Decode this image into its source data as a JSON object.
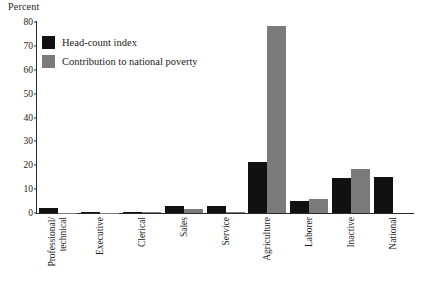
{
  "chart_data": {
    "type": "bar",
    "title": "",
    "ylabel": "Percent",
    "xlabel": "",
    "ylim": [
      0,
      80
    ],
    "yticks": [
      0,
      10,
      20,
      30,
      40,
      50,
      60,
      70,
      80
    ],
    "grid": false,
    "legend_position": "top-left",
    "categories": [
      "Professional/\ntechnical",
      "Executive",
      "Clerical",
      "Sales",
      "Service",
      "Agriculture",
      "Laborer",
      "Inactive",
      "National"
    ],
    "series": [
      {
        "name": "Head-count index",
        "color": "#111111",
        "values": [
          2,
          0.3,
          0.5,
          3,
          3,
          21.5,
          5,
          14.5,
          15
        ]
      },
      {
        "name": "Contribution to national poverty",
        "color": "#7b7b7b",
        "values": [
          0.2,
          0.2,
          0.3,
          1.5,
          0.4,
          78.5,
          6,
          18.5,
          0
        ]
      }
    ]
  },
  "legend": {
    "items": [
      {
        "label": "Head-count index",
        "swatch": "black"
      },
      {
        "label": "Contribution to national poverty",
        "swatch": "gray"
      }
    ]
  },
  "colors": {
    "series_black": "#111111",
    "series_gray": "#7b7b7b",
    "axis": "#2b2b2b",
    "background": "#ffffff"
  }
}
